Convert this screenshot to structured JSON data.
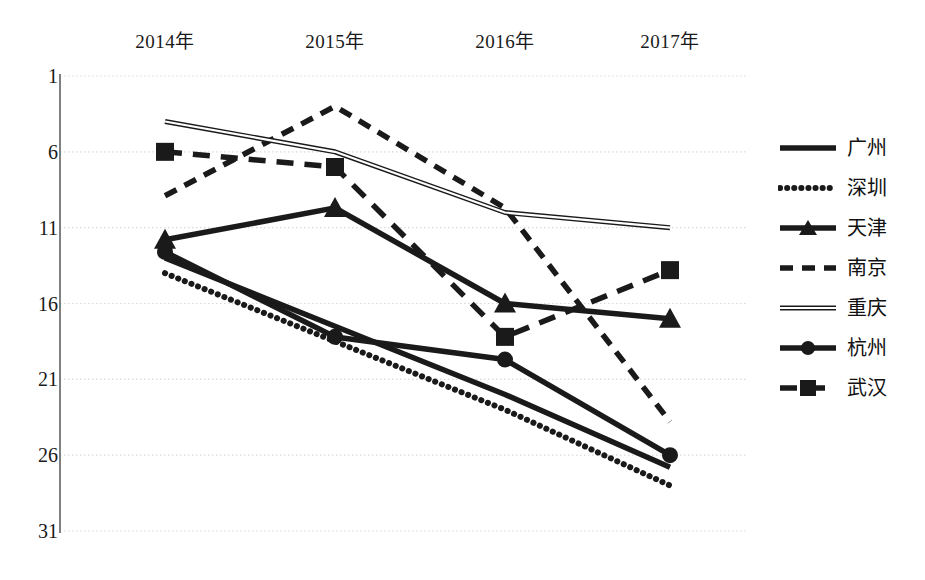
{
  "chart_data": {
    "type": "line",
    "title": "",
    "xlabel": "",
    "ylabel": "",
    "categories": [
      "2014年",
      "2015年",
      "2016年",
      "2017年"
    ],
    "yticks": [
      1,
      6,
      11,
      16,
      21,
      26,
      31
    ],
    "ylim": [
      1,
      31
    ],
    "y_inverted": true,
    "grid": true,
    "legend_position": "right",
    "series": [
      {
        "name": "广州",
        "style": "solid-thick",
        "marker": "none",
        "values": [
          13.0,
          17.5,
          22.0,
          26.8
        ]
      },
      {
        "name": "深圳",
        "style": "dotted",
        "marker": "none",
        "values": [
          14.0,
          18.5,
          23.0,
          28.0
        ]
      },
      {
        "name": "天津",
        "style": "solid-thick",
        "marker": "triangle",
        "values": [
          11.8,
          9.7,
          16.0,
          17.0
        ]
      },
      {
        "name": "南京",
        "style": "dashed",
        "marker": "none",
        "values": [
          8.9,
          3.0,
          9.7,
          23.8
        ]
      },
      {
        "name": "重庆",
        "style": "thin-double",
        "marker": "none",
        "values": [
          4.0,
          6.0,
          10.0,
          11.0
        ]
      },
      {
        "name": "杭州",
        "style": "solid-thick",
        "marker": "circle",
        "values": [
          12.6,
          18.2,
          19.7,
          26.0
        ]
      },
      {
        "name": "武汉",
        "style": "long-dash",
        "marker": "square",
        "values": [
          6.0,
          7.0,
          18.2,
          13.8
        ]
      }
    ],
    "colors": {
      "line": "#1a1a1a",
      "grid": "#d9d9d9",
      "axis": "#808080",
      "text": "#1a1a1a",
      "background": "#ffffff"
    }
  }
}
